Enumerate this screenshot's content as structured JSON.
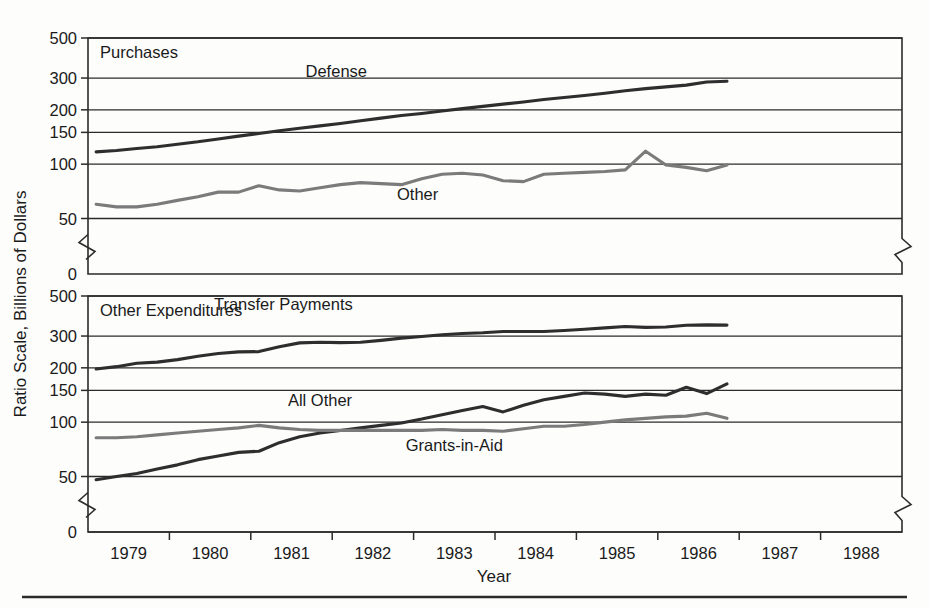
{
  "figure": {
    "y_axis_title": "Ratio Scale, Billions of Dollars",
    "x_axis_title": "Year",
    "panels": [
      {
        "title": "Purchases"
      },
      {
        "title": "Other Expenditures"
      }
    ]
  },
  "chart_data": [
    {
      "type": "line",
      "title": "Purchases",
      "xlabel": "Year",
      "ylabel": "Ratio Scale, Billions of Dollars",
      "scale": "log",
      "ylim": [
        50,
        500
      ],
      "yticks": [
        500,
        300,
        200,
        150,
        100,
        50,
        0
      ],
      "ytick_labels": [
        "500",
        "300",
        "200",
        "150",
        "100",
        "50",
        "0"
      ],
      "axis_break": true,
      "grid": true,
      "legend": "inline-labels",
      "xlim": [
        1978.5,
        1988.5
      ],
      "xticks": [
        1979,
        1980,
        1981,
        1982,
        1983,
        1984,
        1985,
        1986,
        1987,
        1988
      ],
      "xtick_labels": [
        "1979",
        "1980",
        "1981",
        "1982",
        "1983",
        "1984",
        "1985",
        "1986",
        "1987",
        "1988"
      ],
      "series": [
        {
          "name": "Defense",
          "color": "#2e2e2e",
          "label_x": 1981.55,
          "label_y": 330,
          "x": [
            1978.6,
            1978.85,
            1979.1,
            1979.35,
            1979.6,
            1979.85,
            1980.1,
            1980.35,
            1980.6,
            1980.85,
            1981.1,
            1981.35,
            1981.6,
            1981.85,
            1982.1,
            1982.35,
            1982.6,
            1982.85,
            1983.1,
            1983.35,
            1983.6,
            1983.85,
            1984.1,
            1984.35,
            1984.6,
            1984.85,
            1985.1,
            1985.35,
            1985.6,
            1985.85,
            1986.1,
            1986.35
          ],
          "y": [
            117,
            119,
            122,
            125,
            129,
            133,
            138,
            143,
            148,
            153,
            158,
            163,
            168,
            174,
            180,
            186,
            191,
            197,
            203,
            209,
            215,
            221,
            228,
            234,
            240,
            247,
            255,
            262,
            268,
            274,
            285,
            288
          ]
        },
        {
          "name": "Other",
          "color": "#7b7b7b",
          "label_x": 1982.55,
          "label_y": 68,
          "x": [
            1978.6,
            1978.85,
            1979.1,
            1979.35,
            1979.6,
            1979.85,
            1980.1,
            1980.35,
            1980.6,
            1980.85,
            1981.1,
            1981.35,
            1981.6,
            1981.85,
            1982.1,
            1982.35,
            1982.6,
            1982.85,
            1983.1,
            1983.35,
            1983.6,
            1983.85,
            1984.1,
            1984.35,
            1984.6,
            1984.85,
            1985.1,
            1985.35,
            1985.6,
            1985.85,
            1986.1,
            1986.35
          ],
          "y": [
            60,
            58,
            58,
            60,
            63,
            66,
            70,
            70,
            76,
            72,
            71,
            74,
            77,
            79,
            78,
            77,
            83,
            88,
            89,
            87,
            81,
            80,
            88,
            89,
            90,
            91,
            93,
            118,
            99,
            96,
            92,
            99
          ]
        }
      ]
    },
    {
      "type": "line",
      "title": "Other Expenditures",
      "xlabel": "Year",
      "ylabel": "Ratio Scale, Billions of Dollars",
      "scale": "log",
      "ylim": [
        50,
        500
      ],
      "yticks": [
        500,
        300,
        200,
        150,
        100,
        50,
        0
      ],
      "ytick_labels": [
        "500",
        "300",
        "200",
        "150",
        "100",
        "50",
        "0"
      ],
      "axis_break": true,
      "grid": true,
      "legend": "inline-labels",
      "xlim": [
        1978.5,
        1988.5
      ],
      "xticks": [
        1979,
        1980,
        1981,
        1982,
        1983,
        1984,
        1985,
        1986,
        1987,
        1988
      ],
      "xtick_labels": [
        "1979",
        "1980",
        "1981",
        "1982",
        "1983",
        "1984",
        "1985",
        "1986",
        "1987",
        "1988"
      ],
      "series": [
        {
          "name": "Transfer Payments",
          "color": "#2e2e2e",
          "label_x": 1980.9,
          "label_y": 450,
          "x": [
            1978.6,
            1978.85,
            1979.1,
            1979.35,
            1979.6,
            1979.85,
            1980.1,
            1980.35,
            1980.6,
            1980.85,
            1981.1,
            1981.35,
            1981.6,
            1981.85,
            1982.1,
            1982.35,
            1982.6,
            1982.85,
            1983.1,
            1983.35,
            1983.6,
            1983.85,
            1984.1,
            1984.35,
            1984.6,
            1984.85,
            1985.1,
            1985.35,
            1985.6,
            1985.85,
            1986.1,
            1986.35
          ],
          "y": [
            197,
            203,
            212,
            215,
            222,
            232,
            240,
            245,
            246,
            262,
            275,
            277,
            276,
            277,
            284,
            292,
            298,
            305,
            310,
            313,
            318,
            318,
            318,
            322,
            327,
            333,
            339,
            335,
            337,
            344,
            346,
            345
          ]
        },
        {
          "name": "All Other",
          "color": "#2e2e2e",
          "label_x": 1981.35,
          "label_y": 132,
          "x": [
            1978.6,
            1978.85,
            1979.1,
            1979.35,
            1979.6,
            1979.85,
            1980.1,
            1980.35,
            1980.6,
            1980.85,
            1981.1,
            1981.35,
            1981.6,
            1981.85,
            1982.1,
            1982.35,
            1982.6,
            1982.85,
            1983.1,
            1983.35,
            1983.6,
            1983.85,
            1984.1,
            1984.35,
            1984.6,
            1984.85,
            1985.1,
            1985.35,
            1985.6,
            1985.85,
            1986.1,
            1986.35
          ],
          "y": [
            48,
            50,
            52,
            55,
            58,
            62,
            65,
            68,
            69,
            77,
            83,
            87,
            90,
            93,
            96,
            99,
            104,
            110,
            116,
            122,
            114,
            124,
            133,
            139,
            145,
            143,
            139,
            143,
            141,
            156,
            144,
            163
          ]
        },
        {
          "name": "Grants-in-Aid",
          "color": "#7b7b7b",
          "label_x": 1983.0,
          "label_y": 75,
          "x": [
            1978.6,
            1978.85,
            1979.1,
            1979.35,
            1979.6,
            1979.85,
            1980.1,
            1980.35,
            1980.6,
            1980.85,
            1981.1,
            1981.35,
            1981.6,
            1981.85,
            1982.1,
            1982.35,
            1982.6,
            1982.85,
            1983.1,
            1983.35,
            1983.6,
            1983.85,
            1984.1,
            1984.35,
            1984.6,
            1984.85,
            1985.1,
            1985.35,
            1985.6,
            1985.85,
            1986.1,
            1986.35
          ],
          "y": [
            82,
            82,
            83,
            85,
            87,
            89,
            91,
            93,
            96,
            93,
            91,
            90,
            90,
            90,
            90,
            90,
            90,
            91,
            90,
            90,
            89,
            92,
            95,
            95,
            97,
            100,
            103,
            105,
            107,
            108,
            112,
            105
          ]
        }
      ]
    }
  ]
}
